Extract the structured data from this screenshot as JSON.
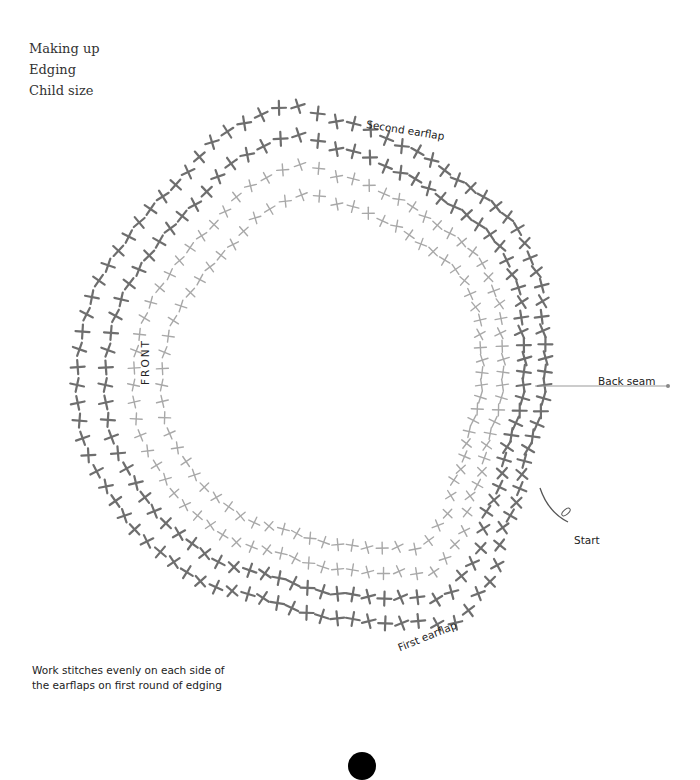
{
  "header": {
    "line1": "Making up",
    "line2": "Edging",
    "line3": "Child size"
  },
  "labels": {
    "second_earflap": "Second earflap",
    "first_earflap": "First earflap",
    "front": "FRONT",
    "back_seam": "Back seam",
    "start": "Start"
  },
  "note": {
    "line1": "Work stitches evenly on each side of",
    "line2": "the earflaps on first round of edging"
  },
  "colors": {
    "outer_stitch": "#6e6e6e",
    "inner_stitch": "#a8a8a8",
    "text": "#222222"
  },
  "chart": {
    "center": [
      345,
      385
    ],
    "symbol": "single-crochet-cross",
    "rounds": [
      {
        "name": "round-1",
        "radius_scale": 1.0,
        "color": "inner"
      },
      {
        "name": "round-2",
        "radius_scale": 1.09,
        "color": "inner"
      },
      {
        "name": "round-3",
        "radius_scale": 1.18,
        "color": "outer"
      },
      {
        "name": "round-4",
        "radius_scale": 1.27,
        "color": "outer"
      }
    ]
  }
}
